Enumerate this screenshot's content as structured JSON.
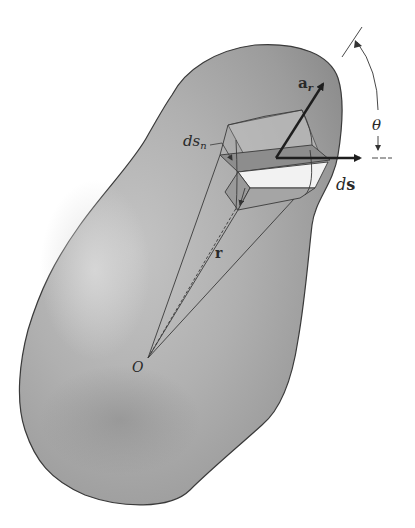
{
  "figure": {
    "labels": {
      "ar": "a",
      "ar_sub": "r",
      "theta": "θ",
      "ds": "ds",
      "ds_d": "d",
      "ds_s": "s",
      "dsn": "ds",
      "dsn_sub": "n",
      "r": "r",
      "origin": "O"
    },
    "colors": {
      "body_light": "#c8c8c8",
      "body_mid": "#a9a9a9",
      "body_dark": "#8e8e8e",
      "outline": "#3a3a3a",
      "face_white": "#f2f2f2",
      "arrow": "#1e1e1e"
    }
  }
}
